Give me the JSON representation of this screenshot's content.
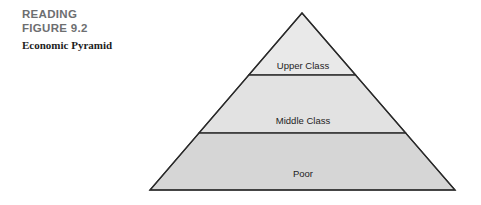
{
  "caption": {
    "kicker_line1": "READING",
    "kicker_line2": "FIGURE 9.2",
    "title": "Economic Pyramid"
  },
  "diagram": {
    "type": "pyramid",
    "title": "Economic Pyramid",
    "orientation": "apex-up",
    "band_count": 3,
    "bands": [
      {
        "label": "Upper Class",
        "rank": 1,
        "position": "top",
        "fill": "#e9e9e9",
        "stroke": "#2b2b2b"
      },
      {
        "label": "Middle Class",
        "rank": 2,
        "position": "middle",
        "fill": "#e2e2e2",
        "stroke": "#2b2b2b"
      },
      {
        "label": "Poor",
        "rank": 3,
        "position": "bottom",
        "fill": "#d6d6d6",
        "stroke": "#2b2b2b"
      }
    ],
    "colors": {
      "outline": "#2b2b2b",
      "divider": "#2b2b2b",
      "background": "#ffffff",
      "kicker_text": "#6d6e70",
      "title_text": "#1c1c1c",
      "label_text": "#1d1d1d"
    },
    "geometry": {
      "apex_x": 302,
      "apex_y": 13,
      "base_left_x": 150,
      "base_right_x": 455,
      "base_y": 190,
      "divider1_y": 75,
      "divider2_y": 133,
      "label1_y": 66,
      "label2_y": 121,
      "label3_y": 174
    }
  }
}
